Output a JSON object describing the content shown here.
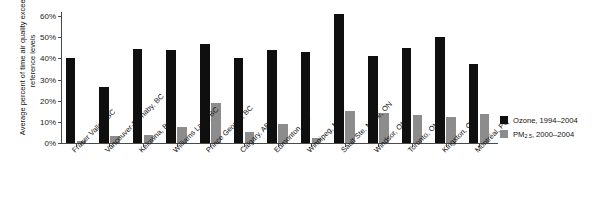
{
  "chart_data": {
    "type": "bar",
    "title": "",
    "xlabel": "",
    "ylabel": "Average percent of time air quality exceeded reference levels",
    "ylim": [
      0,
      60
    ],
    "grid": false,
    "legend_position": "right",
    "ytick_labels": [
      "60%",
      "50%",
      "40%",
      "30%",
      "20%",
      "10%",
      "0%"
    ],
    "ytick_values": [
      60,
      50,
      40,
      30,
      20,
      10,
      0
    ],
    "categories": [
      "Fraser Valley, BC",
      "Vancouver-Burnaby, BC",
      "Kelowna, BC",
      "Williams Lake, BC",
      "Prince George, BC",
      "Calgary, AB",
      "Edmonton, AB",
      "Winnipeg, MB",
      "Sault Ste. Marie, ON",
      "Windsor, ON",
      "Toronto, ON",
      "Kingston, ON",
      "Montréal, PQ"
    ],
    "series": [
      {
        "name": "Ozone, 1994–2004",
        "color": "#0f0f0f",
        "values": [
          40,
          26.5,
          44.5,
          44,
          47,
          40,
          44,
          43,
          61,
          41,
          45,
          50,
          37.5
        ]
      },
      {
        "name": "PM2.5, 2000–2004",
        "color": "#8c8c8c",
        "values": [
          1,
          3.5,
          4,
          7.5,
          19,
          5,
          9,
          2.5,
          15,
          14,
          13,
          12.5,
          13.5
        ]
      }
    ]
  },
  "legend": {
    "items": [
      {
        "label_main": "Ozone, 1994–2004",
        "sub": "",
        "label_tail": "",
        "color": "#0f0f0f"
      },
      {
        "label_main": "PM",
        "sub": "2.5",
        "label_tail": ", 2000–2004",
        "color": "#8c8c8c"
      }
    ]
  }
}
